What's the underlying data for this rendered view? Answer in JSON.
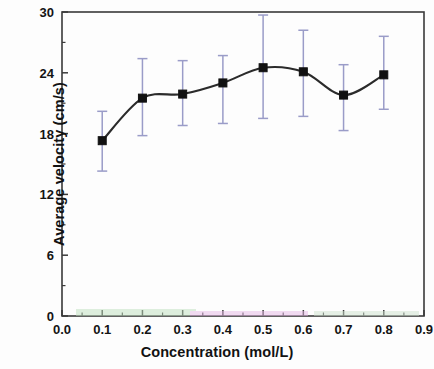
{
  "chart_data": {
    "type": "scatter",
    "title": "",
    "xlabel": "Concentration (mol/L)",
    "ylabel": "Average velocity (cm/s)",
    "xlim": [
      0.0,
      0.9
    ],
    "ylim": [
      0,
      30
    ],
    "xticks": [
      0.0,
      0.1,
      0.2,
      0.3,
      0.4,
      0.5,
      0.6,
      0.7,
      0.8,
      0.9
    ],
    "xtick_labels": [
      "0.0",
      "0.1",
      "0.2",
      "0.3",
      "0.4",
      "0.5",
      "0.6",
      "0.7",
      "0.8",
      "0.9"
    ],
    "yticks": [
      0,
      6,
      12,
      18,
      24,
      30
    ],
    "ytick_labels": [
      "0",
      "6",
      "12",
      "18",
      "24",
      "30"
    ],
    "y_minor_ticks": [
      3,
      9,
      15,
      21,
      27
    ],
    "grid": false,
    "legend": null,
    "marker": "filled-square",
    "marker_color": "#111111",
    "line_color": "#2b2b2b",
    "errorbar_color": "#9a9cc8",
    "frame_color": "#3a3a3a",
    "x": [
      0.1,
      0.2,
      0.3,
      0.4,
      0.5,
      0.6,
      0.7,
      0.8
    ],
    "y": [
      17.3,
      21.5,
      21.9,
      23.0,
      24.5,
      24.1,
      21.8,
      23.8
    ],
    "y_err_upper": [
      2.9,
      3.9,
      3.3,
      2.7,
      5.2,
      4.1,
      3.0,
      3.8
    ],
    "y_err_lower": [
      3.0,
      3.7,
      3.1,
      4.0,
      5.0,
      4.4,
      3.5,
      3.4
    ],
    "series": [
      {
        "name": "Average velocity",
        "values": [
          17.3,
          21.5,
          21.9,
          23.0,
          24.5,
          24.1,
          21.8,
          23.8
        ]
      }
    ]
  },
  "figure": {
    "background_color": "#fdfdfd",
    "plot_area": {
      "left": 62,
      "top": 12,
      "right": 424,
      "bottom": 316
    }
  }
}
